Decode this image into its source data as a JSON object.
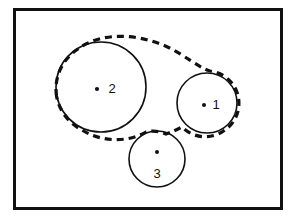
{
  "figure": {
    "background_color": "#ffffff",
    "stroke_color": "#111111",
    "frame": {
      "x": 13,
      "y": 8,
      "width": 270,
      "height": 202,
      "border_width": 3,
      "label": "figure-border"
    },
    "circles": [
      {
        "id": "circle-2",
        "label": "2",
        "cx": 101,
        "cy": 87,
        "r": 45,
        "stroke_width": 1.6,
        "dot": {
          "cx": 97,
          "cy": 89,
          "r": 2.1
        },
        "label_x": 112,
        "label_y": 93
      },
      {
        "id": "circle-1",
        "label": "1",
        "cx": 207,
        "cy": 103,
        "r": 30,
        "stroke_width": 1.6,
        "dot": {
          "cx": 204,
          "cy": 105,
          "r": 2.0
        },
        "label_x": 216,
        "label_y": 109
      },
      {
        "id": "circle-3",
        "label": "3",
        "cx": 157,
        "cy": 159,
        "r": 28,
        "stroke_width": 1.6,
        "dot": {
          "cx": 157,
          "cy": 152,
          "r": 2.0
        },
        "label_x": 157,
        "label_y": 178
      }
    ],
    "hull": {
      "id": "dashed-hull",
      "stroke_width": 3.2,
      "dash_pattern": "7 5",
      "description": "dashed enclosing outline around circles 2 and 1, tangent to top of circle 3",
      "path": "M 56.5 96 A 47.5 47.5 0 0 1 78 49 C 104 29 150 34 182 55 C 196 64 203 69 210 71 A 32.5 32.5 0 0 1 225 130 A 32.5 32.5 0 0 1 182 127 C 176 130 172 132 166 134 A 30.5 30.5 0 0 0 146 132 C 128 143 100 142 82 130 A 47.5 47.5 0 0 1 56.5 96 Z"
    },
    "title": "",
    "caption": ""
  }
}
